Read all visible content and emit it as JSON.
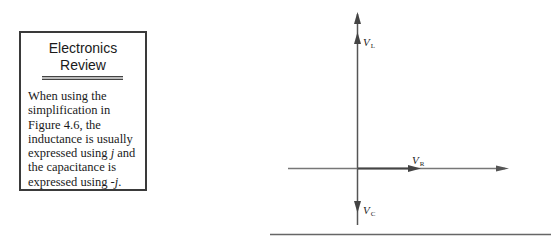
{
  "sidebar_box": {
    "title_line1": "Electronics",
    "title_line2": "Review",
    "body_parts": [
      "When using the simplification in Figure 4.6, the inductance is usually expressed using ",
      "j",
      " and the capacitance is expressed using -",
      "j",
      "."
    ]
  },
  "diagram": {
    "labels": {
      "vl_main": "V",
      "vl_sub": "L",
      "vr_main": "V",
      "vr_sub": "R",
      "vc_main": "V",
      "vc_sub": "C"
    },
    "colors": {
      "line": "#555555",
      "arrow": "#444444",
      "rule": "#666666"
    }
  }
}
